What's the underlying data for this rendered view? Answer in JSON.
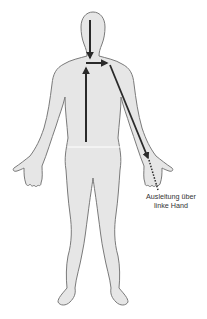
{
  "diagram": {
    "arrows": [
      {
        "name": "neck-down-arrow",
        "direction": "down",
        "from": "head",
        "to": "neck"
      },
      {
        "name": "spine-up-arrow",
        "direction": "up",
        "from": "lower back",
        "to": "upper chest"
      },
      {
        "name": "shoulder-right-arrow",
        "direction": "right",
        "from": "center chest",
        "to": "left shoulder"
      },
      {
        "name": "arm-down-arrow",
        "direction": "down",
        "from": "left shoulder",
        "to": "left hand"
      },
      {
        "name": "hand-exit-dotted-line",
        "style": "dotted",
        "from": "left hand",
        "to": "outside"
      }
    ],
    "label": {
      "line1": "Ausleitung über",
      "line2": "linke Hand"
    },
    "colors": {
      "body_fill": "#e6e6e6",
      "body_outline": "#7a7a7a",
      "arrow": "#2a2a2a",
      "text": "#333333"
    }
  }
}
